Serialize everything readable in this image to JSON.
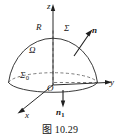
{
  "figure": {
    "caption": "图 10.29",
    "caption_number": "10.29"
  },
  "axes": {
    "z": {
      "label": "z",
      "direction": "up"
    },
    "y": {
      "label": "y",
      "direction": "right"
    },
    "x": {
      "label": "x",
      "direction": "down-left"
    },
    "origin": {
      "label": "O"
    }
  },
  "labels": {
    "radius": "R",
    "surface": "Σ",
    "base_surface": "Σ",
    "base_surface_subscript": "0",
    "region": "Ω",
    "normal_outer": "n",
    "normal_base": "n",
    "normal_base_subscript": "1"
  },
  "colors": {
    "background": "#ffffff",
    "stroke": "#3a3a3a",
    "dashed_stroke": "#6d6d6d",
    "text": "#161616"
  }
}
